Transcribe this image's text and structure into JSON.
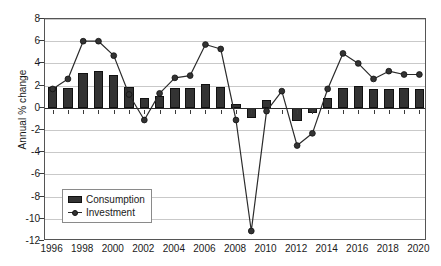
{
  "chart_data": {
    "type": "bar",
    "title": "",
    "subtitle": "",
    "xlabel": "",
    "ylabel": "Annual % change",
    "ylim": [
      -12,
      8
    ],
    "ytick_step": 2,
    "yticks": [
      8,
      6,
      4,
      2,
      0,
      -2,
      -4,
      -6,
      -8,
      -10,
      -12
    ],
    "ytick_labels": [
      "8",
      "6",
      "4",
      "2",
      "0",
      "-2",
      "-4",
      "-6",
      "-8",
      "-10",
      "-12"
    ],
    "xlim": [
      1996,
      2020
    ],
    "x": [
      1996,
      1997,
      1998,
      1999,
      2000,
      2001,
      2002,
      2003,
      2004,
      2005,
      2006,
      2007,
      2008,
      2009,
      2010,
      2011,
      2012,
      2013,
      2014,
      2015,
      2016,
      2017,
      2018,
      2019,
      2020
    ],
    "xtick_values": [
      1996,
      1998,
      2000,
      2002,
      2004,
      2006,
      2008,
      2010,
      2012,
      2014,
      2016,
      2018,
      2020
    ],
    "xtick_labels": [
      "1996",
      "1998",
      "2000",
      "2002",
      "2004",
      "2006",
      "2008",
      "2010",
      "2012",
      "2014",
      "2016",
      "2018",
      "2020"
    ],
    "grid": true,
    "grid_axis": "y",
    "legend_position": "lower left",
    "series": [
      {
        "name": "Consumption",
        "type": "bar",
        "color": "#333333",
        "values": [
          1.9,
          1.8,
          3.1,
          3.3,
          3.0,
          1.9,
          0.9,
          1.1,
          1.8,
          1.8,
          2.1,
          1.9,
          0.3,
          -0.9,
          0.7,
          0.0,
          -1.2,
          -0.5,
          0.9,
          1.8,
          2.0,
          1.7,
          1.7,
          1.8,
          1.7
        ]
      },
      {
        "name": "Investment",
        "type": "line",
        "color": "#2b2b2b",
        "marker": "circle",
        "values": [
          1.7,
          2.6,
          6.0,
          6.0,
          4.7,
          1.2,
          -1.1,
          1.3,
          2.7,
          2.9,
          5.7,
          5.3,
          -1.1,
          -11.1,
          -0.3,
          1.5,
          -3.4,
          -2.3,
          1.7,
          4.9,
          4.0,
          2.6,
          3.3,
          3.0,
          3.0
        ]
      }
    ]
  },
  "legend": {
    "items": [
      {
        "label": "Consumption"
      },
      {
        "label": "Investment"
      }
    ]
  },
  "colors": {
    "bar": "#333333",
    "line": "#2b2b2b",
    "grid": "#c9c9c9",
    "axis": "#555555",
    "text": "#1a1a1a",
    "background": "#ffffff"
  }
}
